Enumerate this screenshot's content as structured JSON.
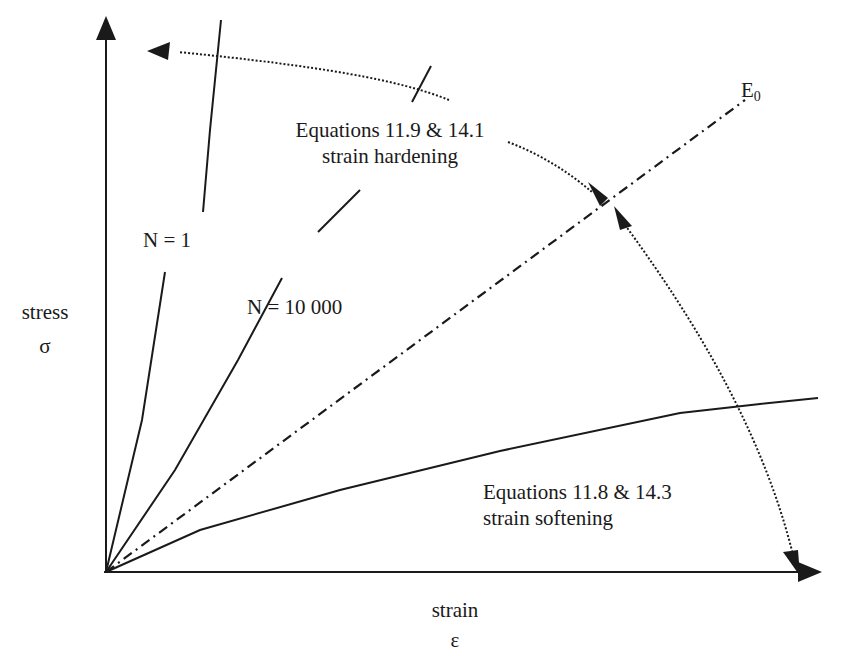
{
  "diagram": {
    "type": "stress-strain schematic",
    "axes": {
      "y_label": "stress",
      "y_symbol": "σ",
      "x_label": "strain",
      "x_symbol": "ε"
    },
    "lines": {
      "reference": {
        "label": "E",
        "subscript": "0",
        "style": "dash-dot"
      },
      "n1": {
        "label": "N = 1",
        "style": "solid"
      },
      "n10000": {
        "label": "N = 10 000",
        "style": "solid"
      },
      "softening": {
        "style": "solid"
      }
    },
    "annotations": {
      "hardening": {
        "line1": "Equations 11.9 & 14.1",
        "line2": "strain hardening"
      },
      "softening": {
        "line1": "Equations 11.8 & 14.3",
        "line2": "strain softening"
      }
    },
    "colors": {
      "ink": "#1a1a1a",
      "background": "#ffffff"
    }
  }
}
